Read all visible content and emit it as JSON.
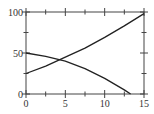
{
  "chart_data": {
    "type": "line",
    "title": "",
    "xlabel": "",
    "ylabel": "",
    "xlim": [
      0,
      15
    ],
    "ylim": [
      0,
      100
    ],
    "grid": false,
    "legend": null,
    "x_ticks": [
      0,
      5,
      10,
      15
    ],
    "x_tick_labels": [
      "0",
      "5",
      "10",
      "15"
    ],
    "y_ticks": [
      0,
      50,
      100
    ],
    "y_tick_labels": [
      "0",
      "50",
      "100"
    ],
    "series": [
      {
        "name": "increasing",
        "x": [
          0,
          2.5,
          5,
          7.5,
          10,
          12.5,
          15
        ],
        "y": [
          25,
          34,
          45,
          56,
          69,
          83,
          98
        ]
      },
      {
        "name": "decreasing",
        "x": [
          0,
          2.5,
          5,
          7.5,
          10,
          12.5,
          13.3
        ],
        "y": [
          50,
          46,
          40,
          31,
          19,
          5,
          0
        ]
      }
    ],
    "color": "#222222"
  }
}
